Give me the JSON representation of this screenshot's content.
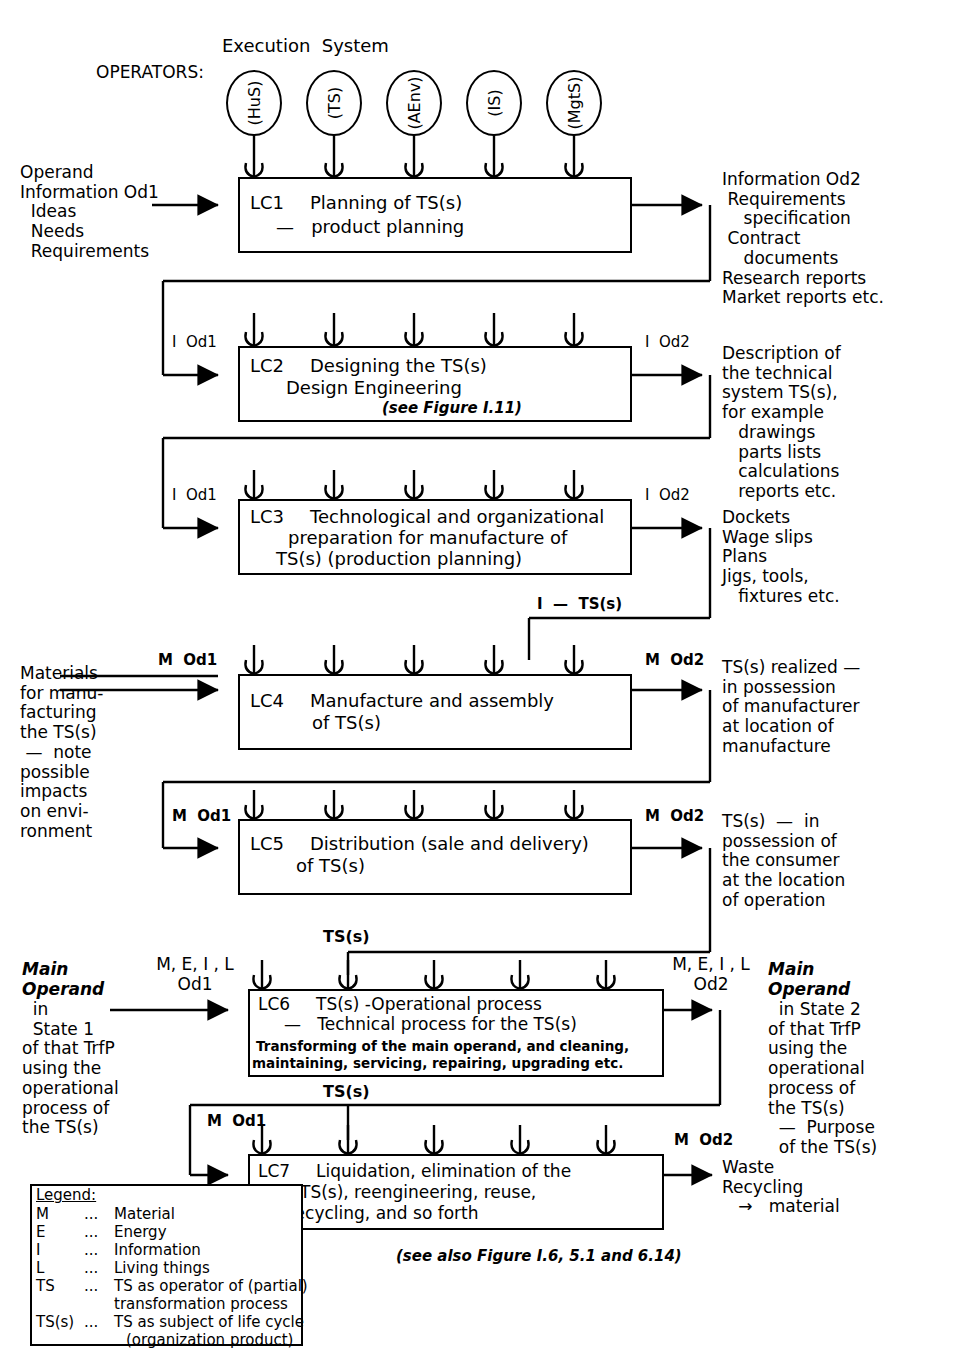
{
  "diagram": {
    "title_top_left": "OPERATORS:",
    "title_top_center": "Execution  System",
    "figure_note": "(see also Figure I.6, 5.1 and 6.14)"
  },
  "operators": [
    {
      "label": "(HuS)"
    },
    {
      "label": "(TS)"
    },
    {
      "label": "(AEnv)"
    },
    {
      "label": "(IS)"
    },
    {
      "label": "(MgtS)"
    }
  ],
  "stages": [
    {
      "id": "LC1",
      "code": "LC1",
      "title": "Planning of TS(s)",
      "subtitle": "—   product planning",
      "detail": "",
      "note": "",
      "input_label": "",
      "output_label": ""
    },
    {
      "id": "LC2",
      "code": "LC2",
      "title": "Designing the TS(s)",
      "subtitle": "Design Engineering",
      "detail": "",
      "note": "(see Figure I.11)",
      "input_label": "I  Od1",
      "output_label": "I  Od2"
    },
    {
      "id": "LC3",
      "code": "LC3",
      "title": "Technological and organizational",
      "subtitle": "preparation for manufacture of",
      "detail": "TS(s) (production planning)",
      "note": "",
      "input_label": "I  Od1",
      "output_label": "I  Od2"
    },
    {
      "id": "LC4",
      "code": "LC4",
      "title": "Manufacture and assembly",
      "subtitle": "of TS(s)",
      "detail": "",
      "note": "",
      "input_label": "M  Od1",
      "output_label": "M  Od2"
    },
    {
      "id": "LC5",
      "code": "LC5",
      "title": "Distribution (sale and delivery)",
      "subtitle": "of TS(s)",
      "detail": "",
      "note": "",
      "input_label": "M  Od1",
      "output_label": "M  Od2"
    },
    {
      "id": "LC6",
      "code": "LC6",
      "title": "TS(s) -Operational process",
      "subtitle": "—   Technical process for the TS(s)",
      "detail": "Transforming of the main operand, and cleaning,",
      "detail2": "maintaining, servicing, repairing, upgrading etc.",
      "note": "",
      "input_label": "M, E, I , L\nOd1",
      "output_label": "M, E, I , L\nOd2"
    },
    {
      "id": "LC7",
      "code": "LC7",
      "title": "Liquidation, elimination of the",
      "subtitle": "TS(s), reengineering, reuse,",
      "detail": "recycling, and so forth",
      "note": "",
      "input_label": "M  Od1",
      "output_label": "M  Od2"
    }
  ],
  "left_texts": {
    "lc1": "Operand\nInformation Od1\n  Ideas\n  Needs\n  Requirements",
    "lc4_materials": "Materials\nfor manu-\nfacturing\nthe TS(s)\n —  note\npossible\nimpacts\non envi-\nronment",
    "lc6_operand_italic": "Main\nOperand",
    "lc6_operand_rest": "  in\n  State 1\nof that TrfP\nusing the\noperational\nprocess of\nthe TS(s)"
  },
  "right_texts": {
    "lc1": "Information Od2\n Requirements\n    specification\n Contract\n    documents\nResearch reports\nMarket reports etc.",
    "lc2": "Description of\nthe technical\nsystem TS(s),\nfor example\n   drawings\n   parts lists\n   calculations\n   reports etc.",
    "lc3": "Dockets\nWage slips\nPlans\nJigs, tools,\n   fixtures etc.",
    "lc4": "TS(s) realized —\nin possession\nof manufacturer\nat location of\nmanufacture",
    "lc5": "TS(s)  —  in\npossession of\nthe consumer\nat the location\nof operation",
    "lc6_italic": "Main\nOperand",
    "lc6_rest": "  in State 2\nof that TrfP\nusing the\noperational\nprocess of\nthe TS(s)\n  —  Purpose\n  of the TS(s)",
    "lc7": "Waste\nRecycling\n   →   material"
  },
  "feedback_labels": {
    "lc4_top": "I  —  TS(s)",
    "lc6_top": "TS(s)",
    "lc7_top": "TS(s)"
  },
  "legend": {
    "title": "Legend:",
    "rows": [
      {
        "sym": "M",
        "dots": "...",
        "text": "Material"
      },
      {
        "sym": "E",
        "dots": "...",
        "text": "Energy"
      },
      {
        "sym": "I",
        "dots": "...",
        "text": "Information"
      },
      {
        "sym": "L",
        "dots": "...",
        "text": "Living things"
      },
      {
        "sym": "TS",
        "dots": "...",
        "text": "TS as operator of (partial)"
      },
      {
        "sym": "",
        "dots": "",
        "text": "transformation process"
      },
      {
        "sym": "TS(s)",
        "dots": "...",
        "text": "TS as subject of life cycle"
      },
      {
        "sym": "",
        "dots": "",
        "text": "(organization product)"
      }
    ]
  },
  "colors": {
    "ink": "#000000",
    "paper": "#ffffff"
  }
}
